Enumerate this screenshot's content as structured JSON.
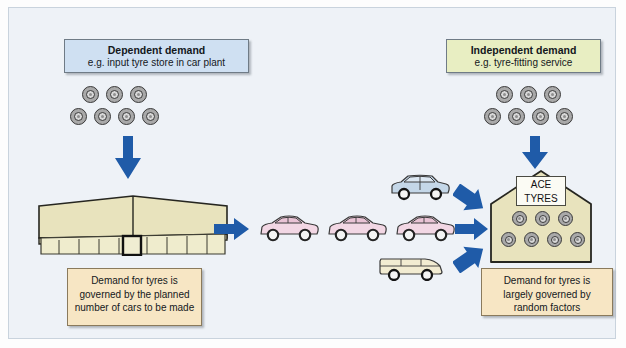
{
  "diagram": {
    "background_color": "#eef2f7",
    "arrow_color": "#1f5ba8"
  },
  "left_label_box": {
    "heading": "Dependent demand",
    "subtext": "e.g. input tyre store in car plant",
    "fill_color": "#cfe0f2"
  },
  "right_label_box": {
    "heading": "Independent demand",
    "subtext": "e.g. tyre-fitting service",
    "fill_color": "#e8eec2"
  },
  "left_note": {
    "text": "Demand for tyres is governed by the planned number of cars to be made",
    "fill_color": "#f7e6c4"
  },
  "right_note": {
    "text": "Demand for tyres is largely governed by random factors",
    "fill_color": "#f7e6c4"
  },
  "left_tyre_stack": {
    "top_row_count": 3,
    "bottom_row_count": 4,
    "icon": "tyre-icon"
  },
  "right_tyre_stack": {
    "top_row_count": 3,
    "bottom_row_count": 4,
    "icon": "tyre-icon"
  },
  "factory": {
    "name": "car-plant-building",
    "fill_color": "#e8e3bd"
  },
  "shop": {
    "sign_line_1": "ACE",
    "sign_line_2": "TYRES",
    "fill_color": "#e8e3bd",
    "top_row_count": 3,
    "bottom_row_count": 4
  },
  "vehicles": {
    "cars_produced_count": 3,
    "car_color": "#f2d7e4",
    "sedan_color": "#c4d7e8",
    "van_color": "#f2ecd2"
  },
  "arrows": [
    {
      "name": "arrow-down-to-factory",
      "direction": "down"
    },
    {
      "name": "arrow-down-to-shop-stock",
      "direction": "down"
    },
    {
      "name": "arrow-factory-to-cars",
      "direction": "right"
    },
    {
      "name": "arrow-sedan-to-shop",
      "direction": "down-right"
    },
    {
      "name": "arrow-cars-to-shop",
      "direction": "right"
    },
    {
      "name": "arrow-van-to-shop",
      "direction": "up-right"
    }
  ]
}
